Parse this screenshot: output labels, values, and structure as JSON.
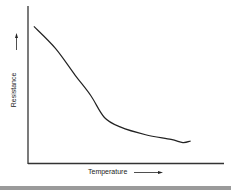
{
  "chart_data": {
    "type": "line",
    "title": "",
    "xlabel": "Temperature",
    "ylabel": "Resistance",
    "xlabel_arrow": "→",
    "ylabel_arrow": "↑",
    "grid": false,
    "legend": null,
    "tick_labels": "none",
    "series": [
      {
        "name": "Resistance vs Temperature",
        "description": "Resistance decreases with rising temperature, steeply at first then leveling off",
        "x": [
          0.03,
          0.14,
          0.24,
          0.32,
          0.39,
          0.47,
          0.6,
          0.73,
          0.79,
          0.83
        ],
        "y": [
          0.87,
          0.73,
          0.56,
          0.43,
          0.29,
          0.23,
          0.18,
          0.15,
          0.13,
          0.14
        ]
      }
    ],
    "xlim": [
      0,
      1
    ],
    "ylim": [
      0,
      1
    ]
  },
  "labels": {
    "x_axis": "Temperature",
    "y_axis": "Resistance"
  }
}
